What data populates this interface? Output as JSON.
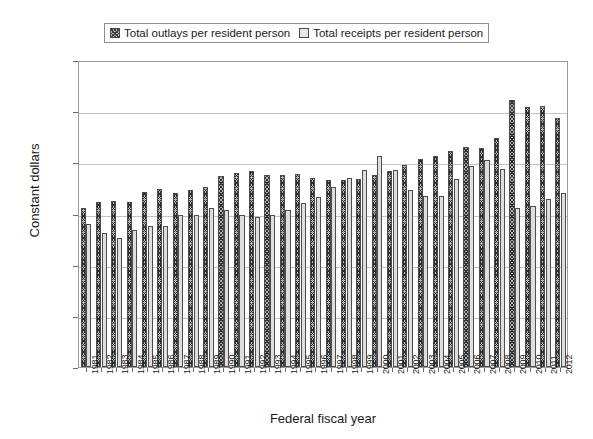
{
  "chart_data": {
    "type": "bar",
    "title": "",
    "xlabel": "Federal fiscal year",
    "ylabel": "Constant dollars",
    "ylim": [
      0,
      12000
    ],
    "ytick_labels": [
      "$12,000",
      "$10,000",
      "$8,000",
      "$6,000",
      "$4,000",
      "$2,000",
      "$0"
    ],
    "ytick_values": [
      12000,
      10000,
      8000,
      6000,
      4000,
      2000,
      0
    ],
    "grid": true,
    "legend_position": "top-center",
    "categories": [
      "1981",
      "1982",
      "1983",
      "1984",
      "1985",
      "1986",
      "1987",
      "1988",
      "1989",
      "1990",
      "1991",
      "1992",
      "1993",
      "1994",
      "1995",
      "1996",
      "1997",
      "1998",
      "1999",
      "2000",
      "2001",
      "2002",
      "2003",
      "2004",
      "2005",
      "2006",
      "2007",
      "2008",
      "2009",
      "2010",
      "2011",
      "2012"
    ],
    "series": [
      {
        "name": "Total outlays per resident person",
        "color": "#b5b5b5",
        "pattern": "crosshatch",
        "values": [
          6200,
          6450,
          6500,
          6450,
          6850,
          6950,
          6800,
          6900,
          7050,
          7450,
          7600,
          7650,
          7500,
          7500,
          7550,
          7400,
          7300,
          7300,
          7350,
          7500,
          7650,
          7900,
          8150,
          8250,
          8450,
          8600,
          8550,
          8950,
          10450,
          10150,
          10200,
          9750
        ]
      },
      {
        "name": "Total receipts per resident person",
        "color": "#dedede",
        "pattern": "solid",
        "values": [
          5600,
          5250,
          5050,
          5350,
          5500,
          5500,
          5950,
          5950,
          6200,
          6150,
          5950,
          5850,
          5950,
          6150,
          6400,
          6650,
          7050,
          7400,
          7700,
          8250,
          7700,
          6900,
          6700,
          6700,
          7350,
          7850,
          8100,
          7750,
          6200,
          6300,
          6550,
          6800
        ]
      }
    ]
  },
  "legend": {
    "entries": [
      {
        "label": "Total outlays per resident person",
        "swatch": "crosshatch-swatch"
      },
      {
        "label": "Total receipts per resident person",
        "swatch": "lightgray-swatch"
      }
    ]
  }
}
